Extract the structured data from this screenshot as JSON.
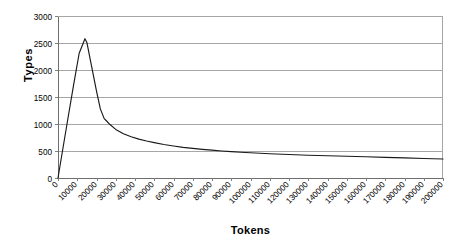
{
  "chart_data": {
    "type": "line",
    "title": "",
    "subtitle": "",
    "xlabel": "Tokens",
    "ylabel": "Types",
    "xlim": [
      0,
      200000
    ],
    "ylim": [
      0,
      3000
    ],
    "grid": "horizontal",
    "legend": "none",
    "line_color": "#1a1a1a",
    "grid_color": "#a6a6a6",
    "axis_color": "#808080",
    "background": "#ffffff",
    "y_ticks": [
      0,
      500,
      1000,
      1500,
      2000,
      2500,
      3000
    ],
    "y_tick_labels": [
      "0",
      "500",
      "1000",
      "1500",
      "2000",
      "2500",
      "3000"
    ],
    "x_ticks": [
      0,
      10000,
      20000,
      30000,
      40000,
      50000,
      60000,
      70000,
      80000,
      90000,
      100000,
      110000,
      120000,
      130000,
      140000,
      150000,
      160000,
      170000,
      180000,
      190000,
      200000
    ],
    "x_tick_labels": [
      "0",
      "10000",
      "20000",
      "30000",
      "40000",
      "50000",
      "60000",
      "70000",
      "80000",
      "90000",
      "100000",
      "110000",
      "120000",
      "130000",
      "140000",
      "150000",
      "160000",
      "170000",
      "180000",
      "190000",
      "200000"
    ],
    "x_tick_label_rotation": -45,
    "series": [
      {
        "name": "types-per-token",
        "x": [
          0,
          2000,
          5000,
          8000,
          11000,
          14000,
          15000,
          17000,
          20000,
          22000,
          24000,
          25000,
          27000,
          30000,
          34000,
          38000,
          42000,
          46000,
          50000,
          55000,
          60000,
          65000,
          70000,
          75000,
          80000,
          85000,
          90000,
          95000,
          100000,
          110000,
          120000,
          130000,
          140000,
          150000,
          160000,
          170000,
          180000,
          190000,
          200000
        ],
        "y": [
          0,
          430,
          1070,
          1700,
          2310,
          2580,
          2510,
          2150,
          1610,
          1280,
          1100,
          1065,
          990,
          900,
          820,
          765,
          720,
          685,
          655,
          620,
          592,
          568,
          548,
          530,
          515,
          500,
          488,
          477,
          467,
          450,
          435,
          422,
          412,
          402,
          393,
          383,
          372,
          362,
          352
        ]
      }
    ]
  },
  "geometry": {
    "plot_left": 58,
    "plot_right": 443,
    "plot_top": 16,
    "plot_bottom": 178
  }
}
